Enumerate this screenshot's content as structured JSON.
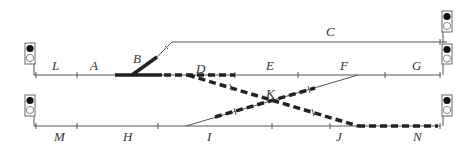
{
  "diagram": {
    "colors": {
      "track": "#555555",
      "route": "#222222",
      "signal_on": "#111111",
      "signal_off": "#ffffff"
    },
    "section_labels": {
      "L": "L",
      "A": "A",
      "B": "B",
      "C": "C",
      "D": "D",
      "E": "E",
      "F": "F",
      "G": "G",
      "K": "K",
      "M": "M",
      "H": "H",
      "I": "I",
      "J": "J",
      "N": "N"
    },
    "tracks": [
      {
        "id": "upper-main",
        "sections": [
          "L",
          "A",
          "D",
          "E",
          "F",
          "G"
        ]
      },
      {
        "id": "siding-C",
        "sections": [
          "B",
          "C"
        ]
      },
      {
        "id": "lower-main",
        "sections": [
          "M",
          "H",
          "I",
          "J",
          "N"
        ]
      },
      {
        "id": "crossover-D-J",
        "via": "K"
      },
      {
        "id": "crossover-I-F",
        "via": "K"
      }
    ],
    "active_route": {
      "from": "A",
      "through": [
        "D",
        "K"
      ],
      "to": "N",
      "style": "thick solid then dashed"
    },
    "signals": [
      {
        "id": "signal-upper-left",
        "aspect": "red-top"
      },
      {
        "id": "signal-siding-right",
        "aspect": "red-top"
      },
      {
        "id": "signal-upper-right",
        "aspect": "red-top"
      },
      {
        "id": "signal-lower-left",
        "aspect": "red-top"
      },
      {
        "id": "signal-lower-right",
        "aspect": "red-top"
      }
    ]
  }
}
